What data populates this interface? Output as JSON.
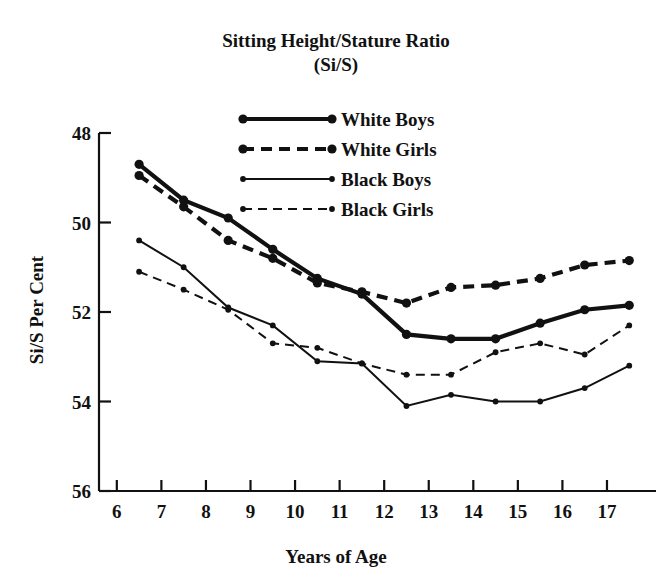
{
  "chart_data": {
    "type": "line",
    "title": "Sitting Height/Stature Ratio",
    "subtitle": "(Si/S)",
    "xlabel": "Years of Age",
    "ylabel": "Si/S Per Cent",
    "xlim": [
      5.6,
      18.1
    ],
    "ylim": [
      48,
      56
    ],
    "xticks": [
      6,
      7,
      8,
      9,
      10,
      11,
      12,
      13,
      14,
      15,
      16,
      17
    ],
    "yticks": [
      48,
      50,
      52,
      54,
      56
    ],
    "grid": false,
    "legend_position": "upper-center",
    "x": [
      6.5,
      7.5,
      8.5,
      9.5,
      10.5,
      11.5,
      12.5,
      13.5,
      14.5,
      15.5,
      16.5,
      17.5
    ],
    "series": [
      {
        "name": "White Boys",
        "style": "solid",
        "weight": "thick",
        "color": "#111111",
        "values": [
          55.3,
          54.5,
          54.1,
          53.4,
          52.75,
          52.4,
          51.5,
          51.4,
          51.4,
          51.75,
          52.05,
          52.15
        ]
      },
      {
        "name": "White Girls",
        "style": "dashed",
        "weight": "thick",
        "color": "#111111",
        "values": [
          55.05,
          54.35,
          53.6,
          53.2,
          52.65,
          52.45,
          52.2,
          52.55,
          52.6,
          52.75,
          53.05,
          53.15
        ]
      },
      {
        "name": "Black Boys",
        "style": "solid",
        "weight": "thin",
        "color": "#111111",
        "values": [
          53.6,
          53.0,
          52.1,
          51.7,
          50.9,
          50.85,
          49.9,
          50.15,
          50.0,
          50.0,
          50.3,
          50.8
        ]
      },
      {
        "name": "Black Girls",
        "style": "dashed",
        "weight": "thin",
        "color": "#111111",
        "values": [
          52.9,
          52.5,
          52.05,
          51.3,
          51.2,
          50.85,
          50.6,
          50.6,
          51.1,
          51.3,
          51.05,
          51.7
        ]
      }
    ]
  },
  "legend": {
    "items": [
      {
        "label": "White Boys"
      },
      {
        "label": "White Girls"
      },
      {
        "label": "Black Boys"
      },
      {
        "label": "Black Girls"
      }
    ]
  },
  "ticklabels": {
    "y": [
      "56",
      "54",
      "52",
      "50",
      "48"
    ],
    "x": [
      "6",
      "7",
      "8",
      "9",
      "10",
      "11",
      "12",
      "13",
      "14",
      "15",
      "16",
      "17"
    ]
  }
}
